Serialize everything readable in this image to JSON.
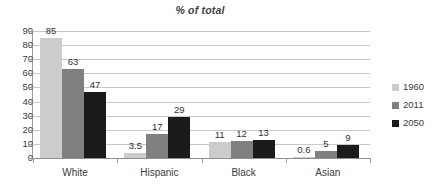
{
  "chart_data": {
    "type": "bar",
    "title": "% of total",
    "xlabel": "",
    "ylabel": "",
    "ylim": [
      0,
      90
    ],
    "yticks": [
      "90",
      "80",
      "70",
      "60",
      "50",
      "40",
      "30",
      "20",
      "10",
      "0"
    ],
    "grid": true,
    "legend_position": "right",
    "categories": [
      "White",
      "Hispanic",
      "Black",
      "Asian"
    ],
    "series": [
      {
        "name": "1960",
        "color": "#cccccc",
        "values": [
          85,
          3.5,
          11,
          0.6
        ],
        "labels": [
          "85",
          "3.5",
          "11",
          "0.6"
        ]
      },
      {
        "name": "2011",
        "color": "#808080",
        "values": [
          63,
          17,
          12,
          5
        ],
        "labels": [
          "63",
          "17",
          "12",
          "5"
        ]
      },
      {
        "name": "2050",
        "color": "#1b1b1b",
        "values": [
          47,
          29,
          13,
          9
        ],
        "labels": [
          "47",
          "29",
          "13",
          "9"
        ]
      }
    ]
  }
}
